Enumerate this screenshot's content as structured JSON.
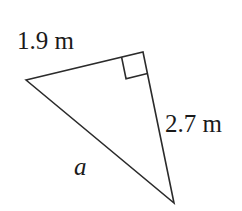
{
  "figure": {
    "type": "right-triangle-diagram",
    "background_color": "#ffffff",
    "stroke_color": "#2b2b2b",
    "stroke_width": 1.6,
    "text_color": "#1a1a1a",
    "vertices": {
      "left": {
        "x": 26,
        "y": 80
      },
      "apex": {
        "x": 143,
        "y": 52
      },
      "bottom": {
        "x": 174,
        "y": 203
      }
    },
    "right_angle_marker": {
      "at_vertex": "apex",
      "size": 22,
      "shown": true
    },
    "sides": [
      {
        "name": "upper-leg",
        "from": "left",
        "to": "apex",
        "label": "1.9 m"
      },
      {
        "name": "right-leg",
        "from": "apex",
        "to": "bottom",
        "label": "2.7 m"
      },
      {
        "name": "hypotenuse",
        "from": "left",
        "to": "bottom",
        "label": "a"
      }
    ],
    "labels": {
      "upper_leg": "1.9 m",
      "right_leg": "2.7 m",
      "hypotenuse": "a"
    }
  }
}
